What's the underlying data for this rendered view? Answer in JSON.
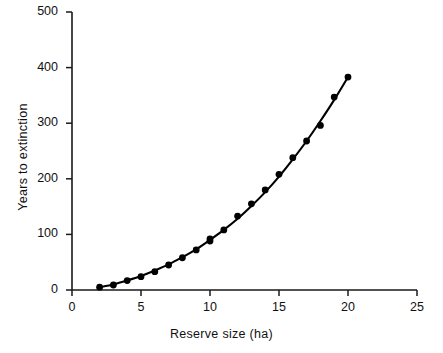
{
  "chart_data": {
    "type": "scatter",
    "title": "",
    "xlabel": "Reserve size (ha)",
    "ylabel": "Years to extinction",
    "xlim": [
      0,
      25
    ],
    "ylim": [
      0,
      500
    ],
    "xticks": [
      0,
      5,
      10,
      15,
      20,
      25
    ],
    "yticks": [
      0,
      100,
      200,
      300,
      400,
      500
    ],
    "xtick_labels": [
      "0",
      "5",
      "10",
      "15",
      "20",
      "25"
    ],
    "ytick_labels": [
      "0",
      "100",
      "200",
      "300",
      "400",
      "500"
    ],
    "grid": false,
    "legend": false,
    "series": [
      {
        "name": "Years to extinction",
        "marker": "filled-circle",
        "color": "#000000",
        "x": [
          2,
          3,
          4,
          5,
          6,
          7,
          8,
          9,
          10,
          10,
          11,
          12,
          13,
          14,
          15,
          16,
          17,
          18,
          19,
          20
        ],
        "y": [
          5,
          9,
          17,
          24,
          33,
          45,
          58,
          72,
          88,
          92,
          108,
          133,
          155,
          180,
          208,
          238,
          268,
          296,
          347,
          383
        ]
      }
    ],
    "fit_curve": {
      "name": "fitted curve",
      "color": "#000000",
      "x": [
        2,
        3,
        4,
        5,
        6,
        7,
        8,
        9,
        10,
        11,
        12,
        13,
        14,
        15,
        16,
        17,
        18,
        19,
        20
      ],
      "y": [
        5,
        10,
        17,
        25,
        35,
        46,
        59,
        73,
        90,
        108,
        128,
        151,
        176,
        204,
        235,
        268,
        304,
        342,
        383
      ]
    }
  },
  "axes": {
    "y_label": "Years to extinction",
    "x_label": "Reserve size (ha)"
  }
}
